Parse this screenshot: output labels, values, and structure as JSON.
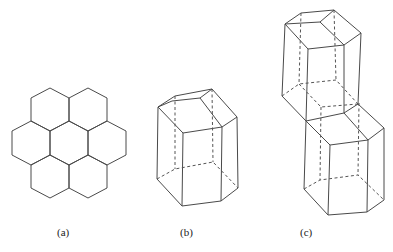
{
  "figure": {
    "panels": [
      {
        "id": "a",
        "label": "(a)",
        "description": "Honeycomb of seven hexagonal cells (2D)"
      },
      {
        "id": "b",
        "label": "(b)",
        "description": "Single hexagonal prism with hidden edges dashed"
      },
      {
        "id": "c",
        "label": "(c)",
        "description": "Two stacked hexagonal prisms, offset diagonally"
      }
    ],
    "colors": {
      "line": "#4a4a4a",
      "background": "#ffffff"
    }
  }
}
